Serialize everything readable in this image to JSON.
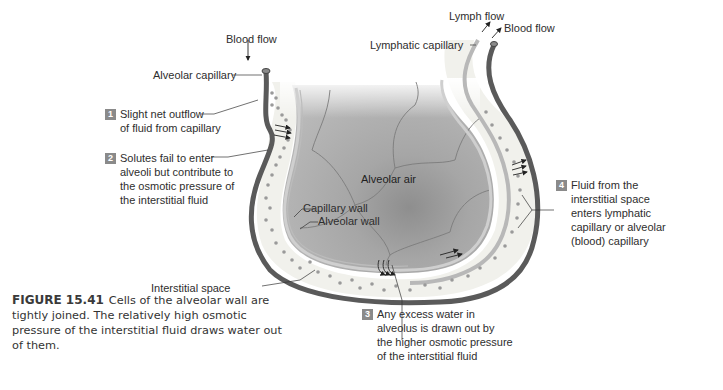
{
  "labels": {
    "blood_flow_in": "Blood flow",
    "alveolar_capillary": "Alveolar capillary",
    "lymph_flow": "Lymph flow",
    "blood_flow_out": "Blood flow",
    "lymphatic_capillary": "Lymphatic capillary",
    "alveolar_air": "Alveolar air",
    "capillary_wall": "Capillary wall",
    "alveolar_wall": "Alveolar wall",
    "interstitial_space": "Interstitial space"
  },
  "steps": [
    {
      "number": "1",
      "lines": [
        "Slight net outflow",
        "of fluid from capillary"
      ]
    },
    {
      "number": "2",
      "lines": [
        "Solutes fail to enter",
        "alveoli but contribute to",
        "the osmotic pressure of",
        "the interstitial fluid"
      ]
    },
    {
      "number": "3",
      "lines": [
        "Any excess water in",
        "alveolus is drawn out by",
        "the higher osmotic pressure",
        "of the interstitial fluid"
      ]
    },
    {
      "number": "4",
      "lines": [
        "Fluid from the",
        "interstitial space",
        "enters lymphatic",
        "capillary or alveolar",
        "(blood) capillary"
      ]
    }
  ],
  "caption": {
    "figure_number": "FIGURE 15.41",
    "text": "Cells of the alveolar wall are tightly joined. The relatively high osmotic pressure of the interstitial fluid draws water out of them."
  },
  "colors": {
    "blood_capillary": "#5a5a5a",
    "lymphatic_capillary": "#b8b8b8",
    "alveolar_air": "#a9a9a9",
    "interstitial": "#f1f1ec",
    "badge": "#8a8a8a"
  }
}
